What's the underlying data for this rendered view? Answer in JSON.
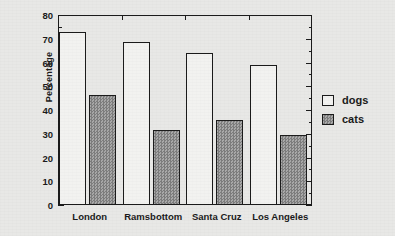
{
  "chart_data": {
    "type": "bar",
    "title": "",
    "xlabel": "",
    "ylabel": "Percentage",
    "ylim": [
      0,
      80
    ],
    "ytick_step": 10,
    "yminor_step": 5,
    "grid": false,
    "legend_position": "right",
    "categories": [
      "London",
      "Ramsbottom",
      "Santa Cruz",
      "Los Angeles"
    ],
    "ytick_labels": [
      "0",
      "10",
      "20",
      "30",
      "40",
      "50",
      "60",
      "70",
      "80"
    ],
    "series": [
      {
        "name": "dogs",
        "values": [
          73,
          68.5,
          64,
          59
        ],
        "fill": "#f2f2f0",
        "pattern": "solid-white"
      },
      {
        "name": "cats",
        "values": [
          46.5,
          31.5,
          36,
          29.5
        ],
        "fill": "#8a8a8a",
        "pattern": "checkerboard-gray"
      }
    ]
  },
  "legend": {
    "entries": [
      {
        "label": "dogs",
        "swatch": "legend-swatch-dogs"
      },
      {
        "label": "cats",
        "swatch": "legend-swatch-cats"
      }
    ]
  },
  "axes": {
    "y_title": "Percentage",
    "line_color": "#1b1b1b"
  },
  "background": {
    "color": "#e8e8e6"
  }
}
